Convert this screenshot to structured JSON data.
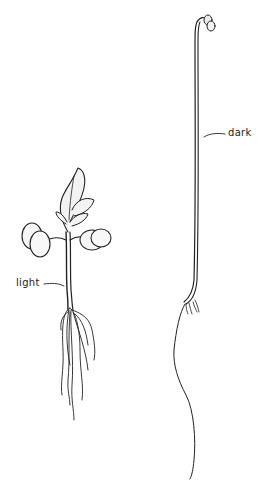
{
  "figure": {
    "subjects": [
      {
        "id": "light",
        "label": "light",
        "description": "seedling grown in light"
      },
      {
        "id": "dark",
        "label": "dark",
        "description": "etiolated seedling grown in dark"
      }
    ]
  }
}
